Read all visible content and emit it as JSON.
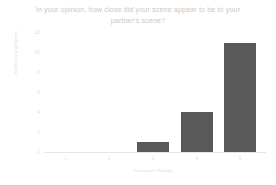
{
  "chart_data": {
    "type": "bar",
    "title": "In your opinion, how close did your scene appear to be to your\npartner's scene?",
    "xlabel": "Participants Ratings",
    "ylabel": "Number of participants",
    "categories": [
      "1",
      "2",
      "3",
      "4",
      "5"
    ],
    "values": [
      0,
      0,
      1,
      4,
      11
    ],
    "ylim": [
      0,
      12
    ],
    "yticks": [
      "12",
      "10",
      "8",
      "6",
      "4",
      "2",
      "0"
    ],
    "grid": false,
    "legend": "none",
    "bar_color": "#595959",
    "text_color": "#dcdcdc",
    "axis_color": "#e6e6e6",
    "background": "#ffffff"
  }
}
